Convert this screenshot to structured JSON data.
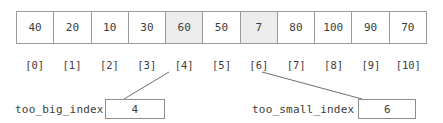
{
  "diagram": {
    "array": {
      "name": "array-cells",
      "values": [
        "40",
        "20",
        "10",
        "30",
        "60",
        "50",
        "7",
        "80",
        "100",
        "90",
        "70"
      ],
      "highlighted_indices": [
        4,
        6
      ],
      "highlight_color": "#ececec",
      "border_color": "#9a9a9a",
      "cell_background": "#ffffff"
    },
    "index_labels": [
      "[0]",
      "[1]",
      "[2]",
      "[3]",
      "[4]",
      "[5]",
      "[6]",
      "[7]",
      "[8]",
      "[9]",
      "[10]"
    ],
    "callouts": [
      {
        "name": "too_big_index",
        "value": "4",
        "points_to_index_label": "[4]"
      },
      {
        "name": "too_small_index",
        "value": "6",
        "points_to_index_label": "[6]"
      }
    ],
    "leader_line_color": "#6f6f6f",
    "text_color": "#3c3c3c",
    "background_color": "#ffffff"
  }
}
